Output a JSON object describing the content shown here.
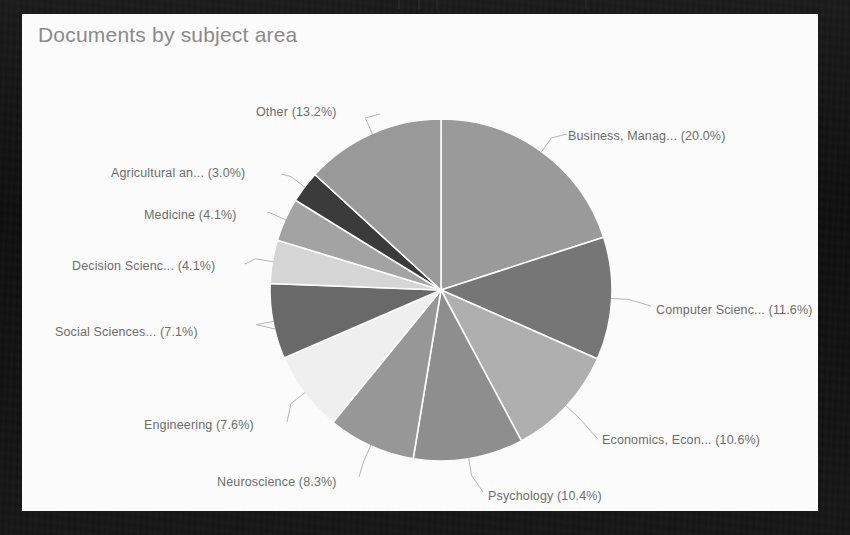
{
  "card": {
    "title": "Documents by subject area",
    "title_color": "#8d8d8d",
    "background": "#ffffff",
    "frame_color": "#141414"
  },
  "chart_data": {
    "type": "pie",
    "title": "Documents by subject area",
    "xlabel": "",
    "ylabel": "",
    "legend_position": "none",
    "grid": false,
    "label_format": "{name} ({value}%)",
    "start_angle_deg": 0,
    "direction": "clockwise",
    "categories": [
      "Business, Manag...",
      "Computer Scienc...",
      "Economics, Econ...",
      "Psychology",
      "Neuroscience",
      "Engineering",
      "Social Sciences...",
      "Decision Scienc...",
      "Medicine",
      "Agricultural an...",
      "Other"
    ],
    "values": [
      20.0,
      11.6,
      10.6,
      10.4,
      8.3,
      7.6,
      7.1,
      4.1,
      4.1,
      3.0,
      13.2
    ],
    "colors": [
      "#9d9d9d",
      "#787878",
      "#b2b2b2",
      "#919191",
      "#9a9a9a",
      "#f3f3f3",
      "#6b6b6b",
      "#d9d9d9",
      "#a6a6a6",
      "#3c3c3c",
      "#9c9c9c"
    ],
    "labels": [
      "Business, Manag... (20.0%)",
      "Computer Scienc... (11.6%)",
      "Economics, Econ... (10.6%)",
      "Psychology (10.4%)",
      "Neuroscience (8.3%)",
      "Engineering (7.6%)",
      "Social Sciences... (7.1%)",
      "Decision Scienc... (4.1%)",
      "Medicine (4.1%)",
      "Agricultural an... (3.0%)",
      "Other (13.2%)"
    ]
  },
  "labels": {
    "business": "Business, Manag... (20.0%)",
    "computer_science": "Computer Scienc... (11.6%)",
    "economics": "Economics, Econ... (10.6%)",
    "psychology": "Psychology (10.4%)",
    "neuroscience": "Neuroscience (8.3%)",
    "engineering": "Engineering (7.6%)",
    "social_sciences": "Social Sciences... (7.1%)",
    "decision_science": "Decision Scienc... (4.1%)",
    "medicine": "Medicine (4.1%)",
    "agricultural": "Agricultural an... (3.0%)",
    "other": "Other (13.2%)"
  }
}
